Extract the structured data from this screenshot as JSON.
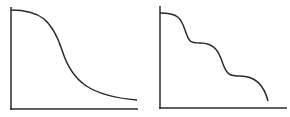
{
  "diagram": {
    "background": "#ffffff",
    "stroke_color": "#2b2b2b",
    "panels": [
      {
        "id": "left",
        "description": "single smooth sigmoidal decay curve",
        "axes": {
          "origin": [
            11,
            109
          ],
          "x_end": 137,
          "y_top": 7
        },
        "curve_path": "M11,10 C40,10 52,20 62,50 C72,82 90,96 137,100"
      },
      {
        "id": "right",
        "description": "stepwise decay curve with two plateaus",
        "axes": {
          "origin": [
            160,
            108
          ],
          "x_end": 287,
          "y_top": 6
        },
        "curve_path": "M160,13 C178,13 181,18 185,30 C189,42 190,43 200,43 C215,43 219,52 223,64 C227,75 230,76 240,76 C255,76 264,85 268,101"
      }
    ]
  }
}
